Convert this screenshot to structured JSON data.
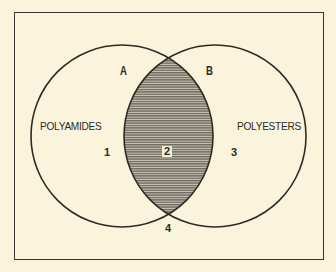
{
  "diagram": {
    "type": "venn",
    "sets": [
      {
        "id": "A",
        "letter": "A",
        "name": "POLYAMIDES"
      },
      {
        "id": "B",
        "letter": "B",
        "name": "POLYESTERS"
      }
    ],
    "regions": [
      {
        "id": "1",
        "label": "1",
        "description": "A only"
      },
      {
        "id": "2",
        "label": "2",
        "description": "A and B (shaded intersection)"
      },
      {
        "id": "3",
        "label": "3",
        "description": "B only"
      },
      {
        "id": "4",
        "label": "4",
        "description": "outside both"
      }
    ],
    "colors": {
      "background": "#fbf4dd",
      "outline": "#2e2a24",
      "shading": "#8c877b"
    }
  }
}
